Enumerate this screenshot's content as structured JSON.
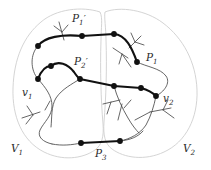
{
  "figure": {
    "kind": "graph-theory-diagram",
    "colors": {
      "region_outline": "#cfcfcf",
      "thin_edge": "#4a4a4a",
      "bold_edge": "#111111",
      "node_fill": "#111111",
      "label_text": "#2a2a2a",
      "background": "#ffffff"
    },
    "labels": [
      {
        "id": "p1-prime",
        "text": "P",
        "sub": "1",
        "prime": "′",
        "x": 72,
        "y": 13
      },
      {
        "id": "p2-prime",
        "text": "P",
        "sub": "2",
        "prime": "′",
        "x": 74,
        "y": 56
      },
      {
        "id": "p1",
        "text": "P",
        "sub": "1",
        "prime": "",
        "x": 146,
        "y": 52
      },
      {
        "id": "p3",
        "text": "P",
        "sub": "3",
        "prime": "",
        "x": 95,
        "y": 148
      },
      {
        "id": "v1",
        "text": "v",
        "sub": "1",
        "prime": "",
        "x": 22,
        "y": 87
      },
      {
        "id": "v2",
        "text": "v",
        "sub": "2",
        "prime": "",
        "x": 163,
        "y": 93
      },
      {
        "id": "V1",
        "text": "V",
        "sub": "1",
        "prime": "",
        "x": 11,
        "y": 143
      },
      {
        "id": "V2",
        "text": "V",
        "sub": "2",
        "prime": "",
        "x": 183,
        "y": 143
      }
    ],
    "nodes": [
      {
        "id": "n-p1p-left",
        "x": 38,
        "y": 46
      },
      {
        "id": "n-p1p-mid",
        "x": 82,
        "y": 36
      },
      {
        "id": "n-p1p-right",
        "x": 114,
        "y": 34
      },
      {
        "id": "n-p1-corner",
        "x": 137,
        "y": 62
      },
      {
        "id": "n-v1",
        "x": 38,
        "y": 79
      },
      {
        "id": "n-p2p-hump",
        "x": 51,
        "y": 66
      },
      {
        "id": "n-p2p-left",
        "x": 80,
        "y": 79
      },
      {
        "id": "n-p2p-mid",
        "x": 114,
        "y": 86
      },
      {
        "id": "n-p2p-right",
        "x": 141,
        "y": 88
      },
      {
        "id": "n-v2",
        "x": 156,
        "y": 96
      },
      {
        "id": "n-p3-left",
        "x": 81,
        "y": 143
      },
      {
        "id": "n-p3-right",
        "x": 120,
        "y": 141
      }
    ],
    "paths": {
      "bold_count": 4,
      "names": [
        "P1",
        "P1′",
        "P2′",
        "P3"
      ]
    }
  }
}
